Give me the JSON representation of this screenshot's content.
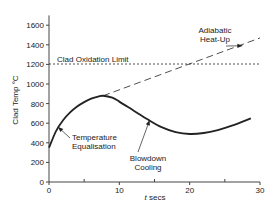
{
  "chart_data": {
    "type": "line",
    "title": "",
    "xlabel": "t secs",
    "ylabel": "Clad Temp °C",
    "xlim": [
      0,
      30
    ],
    "ylim": [
      0,
      1700
    ],
    "x_ticks": [
      0,
      10,
      20,
      30
    ],
    "x_minor_ticks": [
      5,
      15,
      25
    ],
    "y_ticks": [
      0,
      200,
      400,
      600,
      800,
      1000,
      1200,
      1400,
      1600
    ],
    "grid": false,
    "series": [
      {
        "name": "Clad temperature",
        "style": "solid",
        "x": [
          0,
          1,
          2,
          3,
          4,
          5,
          6,
          7,
          7.7,
          9,
          10,
          12,
          14,
          16,
          18,
          20,
          22,
          24,
          26,
          28.7
        ],
        "values": [
          350,
          520,
          630,
          710,
          770,
          815,
          850,
          872,
          880,
          860,
          820,
          730,
          640,
          560,
          510,
          490,
          500,
          530,
          575,
          650
        ]
      },
      {
        "name": "Adiabatic Heat-Up",
        "style": "dashed",
        "x": [
          7.7,
          30
        ],
        "values": [
          880,
          1470
        ]
      },
      {
        "name": "Clad Oxidation Limit",
        "style": "dotted",
        "x": [
          0,
          30
        ],
        "values": [
          1204,
          1204
        ]
      }
    ],
    "annotations": [
      {
        "text": "Clad Oxidation Limit",
        "x": 0.5,
        "y": 1250
      },
      {
        "text": "Adiabatic Heat-Up",
        "x": 24.5,
        "y": 1520,
        "arrow_to": [
          27.5,
          1390
        ]
      },
      {
        "text": "Temperature Equalisation",
        "x": 3,
        "y": 440,
        "arrow_to": [
          1.3,
          560
        ]
      },
      {
        "text": "Blowdown Cooling",
        "x": 12.5,
        "y": 120,
        "arrow_to": [
          14.3,
          630
        ]
      }
    ]
  },
  "labels": {
    "ylabel": "Clad Temp °C",
    "xlabel_italic": "t",
    "xlabel_rest": " secs",
    "oxidation": "Clad Oxidation Limit",
    "adiabatic_1": "Adiabatic",
    "adiabatic_2": "Heat-Up",
    "equal_1": "Temperature",
    "equal_2": "Equalisation",
    "blow_1": "Blowdown",
    "blow_2": "Cooling"
  }
}
